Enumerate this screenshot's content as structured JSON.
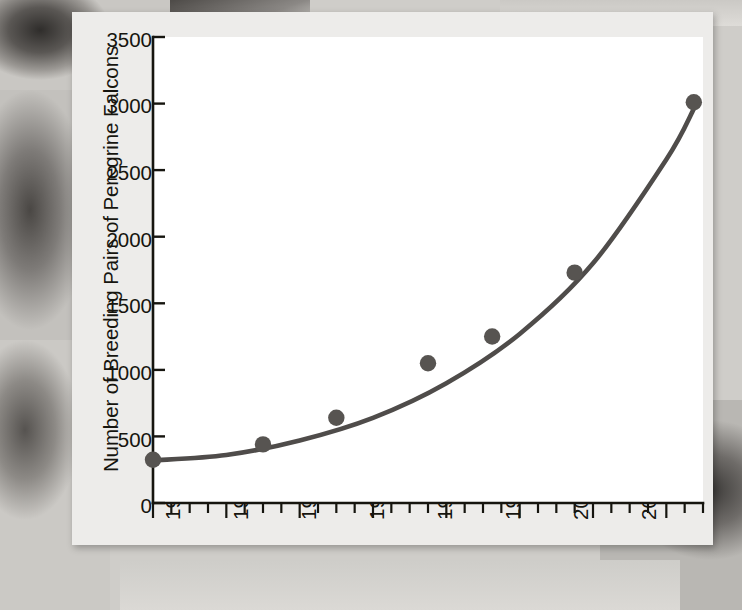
{
  "figure": {
    "background_color": "#edecea",
    "page_background": "grayscale-falcon-photograph",
    "line_color": "#4f4c4a",
    "marker_color": "#575451",
    "axis_color": "#16150f"
  },
  "chart_data": {
    "type": "scatter",
    "title": "",
    "subtitle": "",
    "xlabel": "",
    "ylabel": "Number of Breeding Pairs of Peregrine Falcons",
    "xlim": [
      1976,
      2006
    ],
    "ylim": [
      0,
      3500
    ],
    "grid": false,
    "legend": "none",
    "x_tick_labels": [
      "1976",
      "1980",
      "1984",
      "1988",
      "1992",
      "1998",
      "2000",
      "2004"
    ],
    "x_tick_values": [
      1976,
      1980,
      1984,
      1988,
      1992,
      1996,
      2000,
      2004
    ],
    "x_minor_tick_interval": 1,
    "y_tick_labels": [
      "0",
      "500",
      "1000",
      "1500",
      "2000",
      "2500",
      "3000",
      "3500"
    ],
    "y_tick_values": [
      0,
      500,
      1000,
      1500,
      2000,
      2500,
      3000,
      3500
    ],
    "series": [
      {
        "name": "Breeding pairs of peregrine falcons",
        "marker": "filled-circle",
        "x": [
          1976,
          1982,
          1986,
          1991,
          1994.5,
          1999,
          2005.5
        ],
        "values": [
          325,
          440,
          640,
          1050,
          1250,
          1730,
          3010
        ]
      },
      {
        "name": "Exponential fit curve",
        "marker": "none",
        "x": [
          1976,
          1980,
          1984,
          1988,
          1992,
          1996,
          2000,
          2004,
          2005.5
        ],
        "values": [
          320,
          360,
          470,
          640,
          900,
          1270,
          1800,
          2580,
          2960
        ]
      }
    ]
  },
  "axes": {
    "y_title": "Number of Breeding Pairs of Peregrine Falcons",
    "y_ticks": [
      "3500",
      "3000",
      "2500",
      "2000",
      "1500",
      "1000",
      "500",
      "0"
    ],
    "x_ticks": [
      "1976",
      "1980",
      "1984",
      "1988",
      "1992",
      "1998",
      "2000",
      "2004"
    ]
  }
}
